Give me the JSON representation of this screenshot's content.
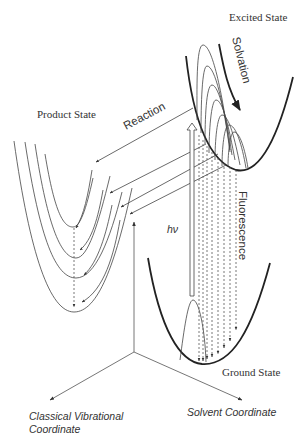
{
  "diagram": {
    "labels": {
      "excited_state": "Excited State",
      "product_state": "Product State",
      "ground_state": "Ground State",
      "solvation": "Solvation",
      "reaction": "Reaction",
      "fluorescence": "Fluorescence",
      "excitation": "hν"
    },
    "axes": {
      "vertical": "",
      "left": [
        "Classical Vibrational",
        "Coordinate"
      ],
      "right": "Solvent Coordinate"
    },
    "colors": {
      "stroke": "#222222",
      "background": "#ffffff"
    }
  }
}
